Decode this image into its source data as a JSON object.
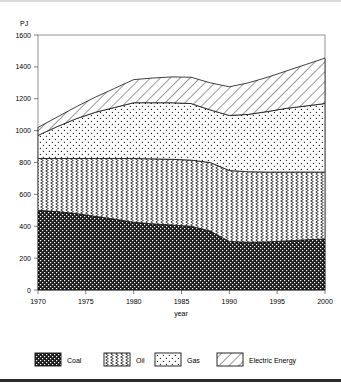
{
  "chart_data": {
    "type": "area",
    "stacked": true,
    "title": "",
    "subtitle": "",
    "xlabel": "year",
    "ylabel": "PJ",
    "yunit": "PJ",
    "xlim": [
      1970,
      2000
    ],
    "ylim": [
      0,
      1600
    ],
    "xticks": [
      1970,
      1975,
      1980,
      1985,
      1990,
      1995,
      2000
    ],
    "yticks": [
      0,
      200,
      400,
      600,
      800,
      1000,
      1200,
      1400,
      1600
    ],
    "grid": false,
    "legend_position": "bottom",
    "x": [
      1970,
      1972,
      1974,
      1976,
      1978,
      1980,
      1982,
      1984,
      1986,
      1988,
      1990,
      1992,
      1994,
      1996,
      1998,
      2000
    ],
    "series": [
      {
        "name": "Coal",
        "pattern": "dark-dotted",
        "values": [
          500,
          492,
          480,
          462,
          445,
          425,
          415,
          408,
          400,
          370,
          305,
          300,
          302,
          308,
          315,
          320
        ]
      },
      {
        "name": "Oil",
        "pattern": "zigzag",
        "values": [
          325,
          333,
          345,
          363,
          380,
          400,
          408,
          412,
          415,
          430,
          445,
          442,
          438,
          432,
          425,
          420
        ]
      },
      {
        "name": "Gas",
        "pattern": "light-dotted",
        "values": [
          145,
          200,
          250,
          290,
          320,
          350,
          352,
          355,
          355,
          330,
          345,
          360,
          380,
          400,
          415,
          430
        ]
      },
      {
        "name": "Electric Energy",
        "pattern": "diagonal-hatch",
        "values": [
          50,
          60,
          75,
          95,
          120,
          145,
          155,
          162,
          165,
          170,
          180,
          198,
          215,
          235,
          260,
          285
        ]
      }
    ],
    "totals": [
      1020,
      1085,
      1150,
      1210,
      1265,
      1320,
      1330,
      1337,
      1335,
      1300,
      1275,
      1300,
      1335,
      1375,
      1415,
      1455
    ],
    "legend": [
      {
        "label": "Coal",
        "pattern": "dark-dotted"
      },
      {
        "label": "Oil",
        "pattern": "zigzag"
      },
      {
        "label": "Gas",
        "pattern": "light-dotted"
      },
      {
        "label": "Electric Energy",
        "pattern": "diagonal-hatch"
      }
    ]
  }
}
